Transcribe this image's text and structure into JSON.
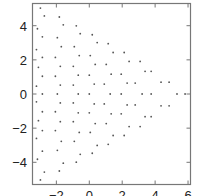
{
  "chart_data": {
    "type": "scatter",
    "title": "",
    "xlabel": "",
    "ylabel": "",
    "xlim": [
      -3.45,
      6.15
    ],
    "ylim": [
      -5.3,
      5.3
    ],
    "grid": false,
    "legend": null,
    "x_ticks": [
      -2,
      0,
      2,
      4,
      6
    ],
    "y_ticks": [
      -4,
      -2,
      0,
      2,
      4
    ],
    "x_tick_labels": [
      "-2",
      "0",
      "2",
      "4",
      "6"
    ],
    "y_tick_labels": [
      "-4",
      "-2",
      "0",
      "2",
      "4"
    ],
    "point_color": "#555555",
    "frame_color": "#777777",
    "series": [
      {
        "name": "points",
        "points": [
          [
            -2.97,
            5.03
          ],
          [
            -2.73,
            4.57
          ],
          [
            -1.82,
            4.51
          ],
          [
            -1.58,
            4.05
          ],
          [
            -0.79,
            3.99
          ],
          [
            -3.15,
            3.82
          ],
          [
            -0.55,
            3.53
          ],
          [
            0.18,
            3.47
          ],
          [
            -2.85,
            3.35
          ],
          [
            -1.94,
            3.3
          ],
          [
            0.48,
            3.01
          ],
          [
            1.15,
            2.95
          ],
          [
            -1.7,
            2.77
          ],
          [
            -0.91,
            2.77
          ],
          [
            1.45,
            2.43
          ],
          [
            2.12,
            2.43
          ],
          [
            -3.21,
            2.6
          ],
          [
            -0.61,
            2.25
          ],
          [
            0.06,
            2.25
          ],
          [
            -2.85,
            2.14
          ],
          [
            -2.06,
            2.14
          ],
          [
            2.42,
            1.91
          ],
          [
            3.09,
            1.91
          ],
          [
            0.36,
            1.73
          ],
          [
            1.03,
            1.73
          ],
          [
            3.39,
            1.33
          ],
          [
            3.76,
            1.33
          ],
          [
            -1.76,
            1.62
          ],
          [
            -0.97,
            1.62
          ],
          [
            -3.09,
            1.56
          ],
          [
            1.33,
            1.16
          ],
          [
            1.94,
            1.16
          ],
          [
            -0.67,
            1.1
          ],
          [
            0.0,
            1.1
          ],
          [
            -2.85,
            1.04
          ],
          [
            -2.06,
            1.04
          ],
          [
            2.3,
            0.64
          ],
          [
            2.79,
            0.64
          ],
          [
            4.36,
            0.69
          ],
          [
            4.85,
            0.69
          ],
          [
            0.3,
            0.58
          ],
          [
            0.91,
            0.58
          ],
          [
            -1.76,
            0.52
          ],
          [
            -0.97,
            0.52
          ],
          [
            -3.21,
            0.46
          ],
          [
            -2.85,
            0.0
          ],
          [
            -1.94,
            0.0
          ],
          [
            -0.67,
            0.0
          ],
          [
            0.0,
            0.0
          ],
          [
            1.27,
            0.0
          ],
          [
            1.94,
            0.0
          ],
          [
            3.21,
            0.0
          ],
          [
            3.76,
            0.0
          ],
          [
            5.33,
            0.0
          ],
          [
            5.82,
            0.0
          ],
          [
            -3.21,
            -0.46
          ],
          [
            -1.76,
            -0.52
          ],
          [
            -0.97,
            -0.52
          ],
          [
            0.3,
            -0.58
          ],
          [
            0.91,
            -0.58
          ],
          [
            2.3,
            -0.64
          ],
          [
            2.79,
            -0.64
          ],
          [
            4.36,
            -0.69
          ],
          [
            4.85,
            -0.69
          ],
          [
            -2.85,
            -1.04
          ],
          [
            -2.06,
            -1.04
          ],
          [
            -0.67,
            -1.1
          ],
          [
            0.0,
            -1.1
          ],
          [
            1.33,
            -1.16
          ],
          [
            1.94,
            -1.16
          ],
          [
            3.39,
            -1.33
          ],
          [
            3.76,
            -1.33
          ],
          [
            -3.09,
            -1.56
          ],
          [
            -1.76,
            -1.62
          ],
          [
            -0.97,
            -1.62
          ],
          [
            0.36,
            -1.73
          ],
          [
            1.03,
            -1.73
          ],
          [
            2.42,
            -1.91
          ],
          [
            3.09,
            -1.91
          ],
          [
            -2.85,
            -2.14
          ],
          [
            -2.06,
            -2.14
          ],
          [
            -0.61,
            -2.25
          ],
          [
            0.06,
            -2.25
          ],
          [
            1.45,
            -2.43
          ],
          [
            2.12,
            -2.43
          ],
          [
            -3.21,
            -2.6
          ],
          [
            -1.7,
            -2.77
          ],
          [
            -0.91,
            -2.77
          ],
          [
            0.48,
            -3.01
          ],
          [
            1.15,
            -2.95
          ],
          [
            -2.85,
            -3.35
          ],
          [
            -1.94,
            -3.3
          ],
          [
            -0.55,
            -3.53
          ],
          [
            0.18,
            -3.47
          ],
          [
            -3.15,
            -3.82
          ],
          [
            -0.79,
            -3.99
          ],
          [
            -1.58,
            -4.05
          ],
          [
            -1.82,
            -4.51
          ],
          [
            -2.73,
            -4.57
          ],
          [
            -2.97,
            -5.03
          ]
        ]
      }
    ]
  }
}
